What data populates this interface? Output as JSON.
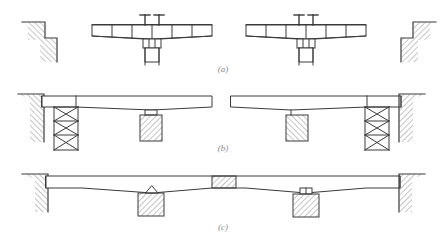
{
  "figure": {
    "stroke_color": "#3a3a3a",
    "hatch_color": "#6e6e6e",
    "caption_color": "#8a8a8a",
    "background": "#ffffff"
  },
  "captions": {
    "a": "(a)",
    "b": "(b)",
    "c": "(c)"
  },
  "panels": [
    {
      "id": "a",
      "label": "(a)",
      "description": "Balanced cantilever segments erected symmetrically from two piers using form travelers",
      "elements": [
        "left-abutment-stepped-hatched",
        "left-cantilever-deck-segmented",
        "left-form-traveler-posts",
        "left-pier-shaft",
        "right-cantilever-deck-segmented",
        "right-form-traveler-posts",
        "right-pier-shaft",
        "right-abutment-stepped-hatched"
      ],
      "segment_count_per_cantilever": 6,
      "form_traveler_count": 2
    },
    {
      "id": "b",
      "label": "(b)",
      "description": "Deck spans supported on temporary falsework towers and permanent hatched piers",
      "elements": [
        "left-abutment-hatched",
        "left-deck-girder",
        "left-falsework-tower",
        "left-concrete-pier-hatched",
        "right-deck-girder",
        "right-concrete-pier-hatched",
        "right-falsework-tower",
        "right-abutment-hatched"
      ],
      "tower_bay_count": 3,
      "tower_bracing": "x-braced"
    },
    {
      "id": "c",
      "label": "(c)",
      "description": "Completed continuous bridge with midspan closure segment, pinned and expansion bearings",
      "elements": [
        "left-abutment-hatched",
        "continuous-deck-girder",
        "midspan-closure-segment-hatched",
        "left-pier-pinned-bearing",
        "left-concrete-pier-hatched",
        "right-pier-expansion-bearing",
        "right-concrete-pier-hatched",
        "right-abutment-hatched"
      ],
      "bearing_types": [
        "pinned-triangular",
        "roller-rectangular"
      ]
    }
  ]
}
